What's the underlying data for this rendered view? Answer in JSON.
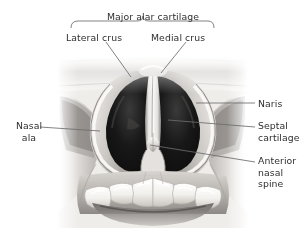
{
  "figure": {
    "view": "inferior / basal view of external nose, nasal cartilages and maxillary incisors",
    "render_style": "grayscale medical illustration",
    "colors": {
      "background": "#ffffff",
      "label_text": "#2f2f2f",
      "leader_line": "#6d6d6d",
      "brace_line": "#6d6d6d",
      "tissue_light": "#f2f0ee",
      "tissue_mid": "#b9b6b3",
      "tissue_shadow": "#6a6765",
      "nostril_dark": "#121212",
      "tooth_enamel": "#f6f5f2"
    }
  },
  "labels": {
    "major_alar_cartilage": "Major alar cartilage",
    "lateral_crus": "Lateral crus",
    "medial_crus": "Medial crus",
    "naris": "Naris",
    "septal_cartilage": "Septal\ncartilage",
    "septal_cartilage_line1": "Septal",
    "septal_cartilage_line2": "cartilage",
    "anterior_nasal_spine_line1": "Anterior",
    "anterior_nasal_spine_line2": "nasal spine",
    "nasal_ala_line1": "Nasal",
    "nasal_ala_line2": "ala"
  },
  "annotations": [
    {
      "id": "major-alar-cartilage",
      "text": "Major alar cartilage",
      "side": "top",
      "connector": "brace",
      "brace_span_px": [
        71,
        214
      ],
      "brace_apex_px": [
        143,
        20
      ]
    },
    {
      "id": "lateral-crus",
      "text": "Lateral crus",
      "side": "top-left",
      "connector": "leader-line",
      "from_px": [
        106,
        41
      ],
      "to_px": [
        131,
        76
      ]
    },
    {
      "id": "medial-crus",
      "text": "Medial crus",
      "side": "top-right",
      "connector": "leader-line",
      "from_px": [
        186,
        41
      ],
      "to_px": [
        160,
        73
      ]
    },
    {
      "id": "naris",
      "text": "Naris",
      "side": "right",
      "connector": "leader-line",
      "from_px": [
        255,
        103
      ],
      "to_px": [
        196,
        103
      ]
    },
    {
      "id": "septal-cartilage",
      "text": "Septal cartilage",
      "side": "right",
      "connector": "leader-line",
      "from_px": [
        255,
        127
      ],
      "to_px": [
        168,
        120
      ]
    },
    {
      "id": "anterior-nasal-spine",
      "text": "Anterior nasal spine",
      "side": "right",
      "connector": "leader-line",
      "from_px": [
        255,
        162
      ],
      "to_px": [
        150,
        145
      ]
    },
    {
      "id": "nasal-ala",
      "text": "Nasal ala",
      "side": "left",
      "connector": "leader-line",
      "from_px": [
        40,
        127
      ],
      "to_px": [
        100,
        131
      ]
    }
  ]
}
